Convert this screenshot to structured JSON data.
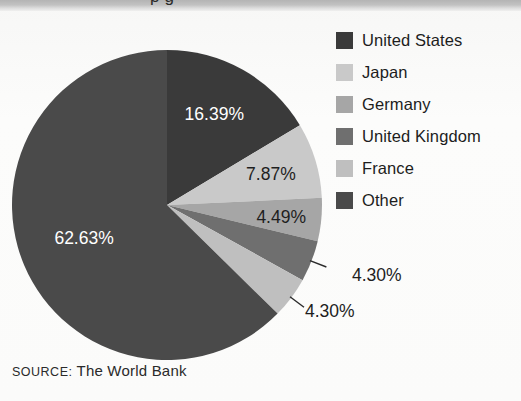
{
  "figure": {
    "background_color": "#fbfbfa",
    "top_band_color": "#c2c2c2",
    "clipped_title_fragment": "p g"
  },
  "source_note": {
    "prefix": "SOURCE:",
    "text": " The World Bank"
  },
  "legend": {
    "position": "right",
    "items": [
      {
        "label": "United States",
        "color": "#3a3a3a"
      },
      {
        "label": "Japan",
        "color": "#c9c9c9"
      },
      {
        "label": "Germany",
        "color": "#a6a6a6"
      },
      {
        "label": "United Kingdom",
        "color": "#6f6f6f"
      },
      {
        "label": "France",
        "color": "#bfbfbf"
      },
      {
        "label": "Other",
        "color": "#4a4a4a"
      }
    ]
  },
  "chart_data": {
    "type": "pie",
    "title": "",
    "xlabel": "",
    "ylabel": "",
    "legend_position": "right",
    "grid": false,
    "start_angle_deg": 0,
    "direction": "clockwise",
    "categories": [
      "United States",
      "Japan",
      "Germany",
      "United Kingdom",
      "France",
      "Other"
    ],
    "values": [
      16.39,
      7.87,
      4.49,
      4.3,
      4.3,
      62.63
    ],
    "labels": [
      "16.39%",
      "7.87%",
      "4.49%",
      "4.30%",
      "4.30%",
      "62.63%"
    ],
    "colors": [
      "#3a3a3a",
      "#c9c9c9",
      "#a6a6a6",
      "#6f6f6f",
      "#bfbfbf",
      "#4a4a4a"
    ],
    "label_text_colors": [
      "#ffffff",
      "#1e1e1e",
      "#1e1e1e",
      "#1e1e1e",
      "#1e1e1e",
      "#ffffff"
    ],
    "label_placement": [
      "inside",
      "inside",
      "inside",
      "outside",
      "outside",
      "inside"
    ],
    "units": "percent"
  }
}
